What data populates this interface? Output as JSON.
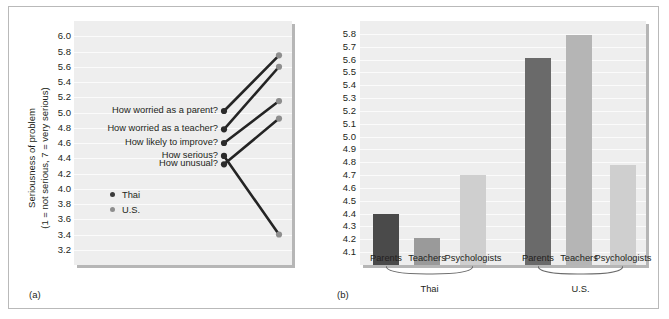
{
  "figure": {
    "panel_a_tag": "(a)",
    "panel_b_tag": "(b)"
  },
  "panel_a": {
    "axis_title_line1": "Seriousness of problem",
    "axis_title_line2": "(1 = not serious, 7 = very serious)",
    "yticks": [
      "6.0",
      "5.8",
      "5.6",
      "5.4",
      "5.2",
      "5.0",
      "4.8",
      "4.6",
      "4.4",
      "4.2",
      "4.0",
      "3.8",
      "3.6",
      "3.4",
      "3.2"
    ],
    "items": [
      {
        "label": "How worried as a parent?",
        "thai": 5.02,
        "us": 5.75
      },
      {
        "label": "How worried as a teacher?",
        "thai": 4.78,
        "us": 5.6
      },
      {
        "label": "How likely to improve?",
        "thai": 4.6,
        "us": 5.15
      },
      {
        "label": "How serious?",
        "thai": 4.43,
        "us": 3.4
      },
      {
        "label": "How unusual?",
        "thai": 4.32,
        "us": 4.92
      }
    ],
    "legend": [
      {
        "label": "Thai",
        "color": "#3a3a3a"
      },
      {
        "label": "U.S.",
        "color": "#8e8e8e"
      }
    ]
  },
  "panel_b": {
    "yticks": [
      "5.8",
      "5.7",
      "5.6",
      "5.5",
      "5.4",
      "5.3",
      "5.2",
      "5.1",
      "5.0",
      "4.9",
      "4.8",
      "4.7",
      "4.6",
      "4.5",
      "4.4",
      "4.3",
      "4.2",
      "4.1"
    ],
    "categories": [
      "Parents",
      "Teachers",
      "Psychologists",
      "Parents",
      "Teachers",
      "Psychologists"
    ],
    "group_labels": [
      "Thai",
      "U.S."
    ],
    "bars": [
      {
        "category": "Parents",
        "group": "Thai",
        "value": 4.4,
        "color": "#4a4a4a"
      },
      {
        "category": "Teachers",
        "group": "Thai",
        "value": 4.21,
        "color": "#9a9a9a"
      },
      {
        "category": "Psychologists",
        "group": "Thai",
        "value": 4.7,
        "color": "#cfcfcf"
      },
      {
        "category": "Parents",
        "group": "U.S.",
        "value": 5.61,
        "color": "#6a6a6a"
      },
      {
        "category": "Teachers",
        "group": "U.S.",
        "value": 5.79,
        "color": "#b5b5b5"
      },
      {
        "category": "Psychologists",
        "group": "U.S.",
        "value": 4.78,
        "color": "#cfcfcf"
      }
    ]
  },
  "chart_data": [
    {
      "type": "line",
      "panel": "(a)",
      "title": "",
      "xlabel": "",
      "ylabel": "Seriousness of problem (1 = not serious, 7 = very serious)",
      "ylim": [
        3.1,
        6.1
      ],
      "grid": true,
      "legend_position": "inside-lower-left",
      "x": [
        "Thai",
        "U.S."
      ],
      "series": [
        {
          "name": "How worried as a parent?",
          "values": [
            5.02,
            5.75
          ]
        },
        {
          "name": "How worried as a teacher?",
          "values": [
            4.78,
            5.6
          ]
        },
        {
          "name": "How likely to improve?",
          "values": [
            4.6,
            5.15
          ]
        },
        {
          "name": "How serious?",
          "values": [
            4.43,
            3.4
          ]
        },
        {
          "name": "How unusual?",
          "values": [
            4.32,
            4.92
          ]
        }
      ],
      "tick_labels": [
        "6.0",
        "5.8",
        "5.6",
        "5.4",
        "5.2",
        "5.0",
        "4.8",
        "4.6",
        "4.4",
        "4.2",
        "4.0",
        "3.8",
        "3.6",
        "3.4",
        "3.2"
      ]
    },
    {
      "type": "bar",
      "panel": "(b)",
      "title": "",
      "xlabel": "",
      "ylabel": "",
      "ylim": [
        4.05,
        5.85
      ],
      "grid": true,
      "categories": [
        "Parents",
        "Teachers",
        "Psychologists",
        "Parents",
        "Teachers",
        "Psychologists"
      ],
      "groups": [
        "Thai",
        "Thai",
        "Thai",
        "U.S.",
        "U.S.",
        "U.S."
      ],
      "values": [
        4.4,
        4.21,
        4.7,
        5.61,
        5.79,
        4.78
      ],
      "tick_labels": [
        "5.8",
        "5.7",
        "5.6",
        "5.5",
        "5.4",
        "5.3",
        "5.2",
        "5.1",
        "5.0",
        "4.9",
        "4.8",
        "4.7",
        "4.6",
        "4.5",
        "4.4",
        "4.3",
        "4.2",
        "4.1"
      ]
    }
  ]
}
